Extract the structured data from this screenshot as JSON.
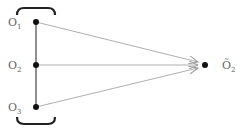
{
  "diagram": {
    "sources": [
      {
        "id": "O1",
        "label": "O",
        "sub": "1",
        "x": 36,
        "y": 22
      },
      {
        "id": "O2",
        "label": "O",
        "sub": "2",
        "x": 36,
        "y": 65
      },
      {
        "id": "O3",
        "label": "O",
        "sub": "3",
        "x": 36,
        "y": 107
      }
    ],
    "target": {
      "id": "O2_tilde",
      "label": "Õ",
      "sub": "2",
      "x": 205,
      "y": 65
    },
    "colors": {
      "line": "#555555",
      "arrow": "#9a9a9a",
      "dot": "#111111",
      "bracket": "#222222",
      "text": "#666666"
    }
  }
}
